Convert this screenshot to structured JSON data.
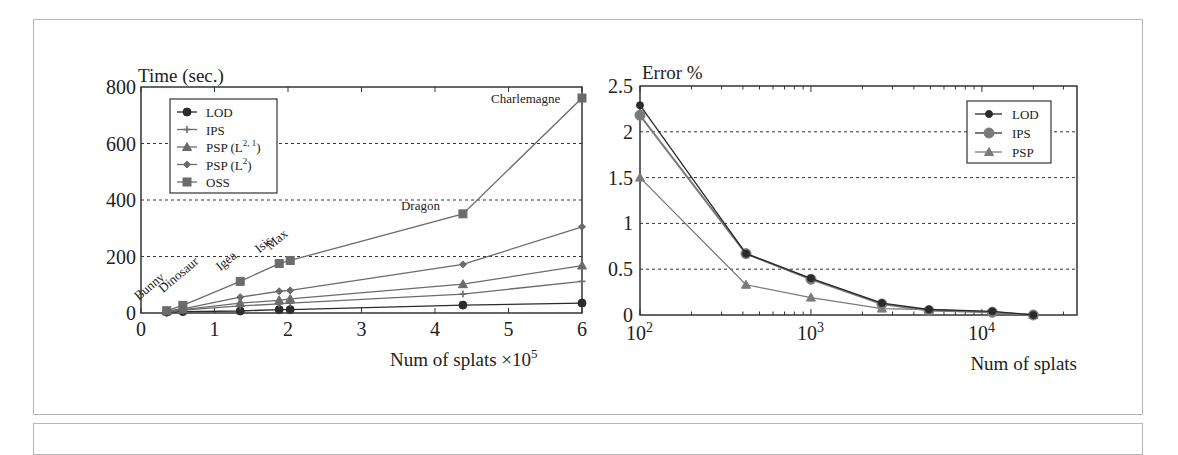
{
  "chart_data": [
    {
      "type": "line",
      "title": "",
      "ylabel": "Time (sec.)",
      "xlabel": "Num of splats",
      "xlabel_suffix": "×10",
      "xlabel_exp": "5",
      "xlim": [
        0,
        6
      ],
      "ylim": [
        0,
        800
      ],
      "xticks": [
        "0",
        "1",
        "2",
        "3",
        "4",
        "5",
        "6"
      ],
      "yticks": [
        "0",
        "200",
        "400",
        "600",
        "800"
      ],
      "grid": "horizontal dashed at 200, 400, 600",
      "legend_position": "upper left",
      "legend": [
        {
          "label": "LOD",
          "sup": "",
          "marker": "circle"
        },
        {
          "label": "IPS",
          "sup": "",
          "marker": "plus"
        },
        {
          "label": "PSP (L",
          "sup": "2, 1",
          "close": ")",
          "marker": "triangle"
        },
        {
          "label": "PSP (L",
          "sup": "2",
          "close": ")",
          "marker": "diamond"
        },
        {
          "label": "OSS",
          "sup": "",
          "marker": "square"
        }
      ],
      "x": [
        0.35,
        0.57,
        1.35,
        1.88,
        2.03,
        4.38,
        6.0
      ],
      "annotations": [
        "Bunny",
        "Dinosaur",
        "Igea",
        "Isis",
        "Max",
        "Dragon",
        "Charlemagne"
      ],
      "series": [
        {
          "name": "LOD",
          "values": [
            3,
            5,
            7,
            12,
            12,
            28,
            35
          ]
        },
        {
          "name": "IPS",
          "values": [
            5,
            10,
            25,
            32,
            35,
            67,
            112
          ]
        },
        {
          "name": "PSP (L2,1)",
          "values": [
            6,
            12,
            35,
            45,
            50,
            102,
            168
          ]
        },
        {
          "name": "PSP (L2)",
          "values": [
            7,
            15,
            56,
            77,
            80,
            172,
            305
          ]
        },
        {
          "name": "OSS",
          "values": [
            8,
            27,
            112,
            175,
            186,
            351,
            761
          ]
        }
      ]
    },
    {
      "type": "line",
      "title": "",
      "ylabel": "Error %",
      "xlabel": "Num of splats",
      "xscale": "log",
      "xlim": [
        100,
        36000
      ],
      "ylim": [
        0,
        2.5
      ],
      "xticks": [
        {
          "base": "10",
          "exp": "2"
        },
        {
          "base": "10",
          "exp": "3"
        },
        {
          "base": "10",
          "exp": "4"
        }
      ],
      "yticks": [
        "0",
        "0.5",
        "1",
        "1.5",
        "2",
        "2.5"
      ],
      "grid": "horizontal dashed at 0.5, 1, 1.5, 2",
      "legend_position": "upper right",
      "legend": [
        {
          "label": "LOD",
          "marker": "small-circle"
        },
        {
          "label": "IPS",
          "marker": "large-circle"
        },
        {
          "label": "PSP",
          "marker": "triangle"
        }
      ],
      "x": [
        100,
        417,
        1000,
        2600,
        4900,
        11500,
        20000
      ],
      "series": [
        {
          "name": "LOD",
          "values": [
            2.29,
            0.67,
            0.4,
            0.13,
            0.06,
            0.04,
            0.0
          ]
        },
        {
          "name": "IPS",
          "values": [
            2.18,
            0.67,
            0.39,
            0.12,
            0.05,
            0.03,
            0.0
          ]
        },
        {
          "name": "PSP",
          "values": [
            1.5,
            0.33,
            0.19,
            0.07,
            0.06,
            0.03,
            0.0
          ]
        }
      ]
    }
  ],
  "colors": {
    "lod": "#2b2b2b",
    "series": "#6b6b6b",
    "axis": "#333333",
    "grid": "#333333"
  }
}
